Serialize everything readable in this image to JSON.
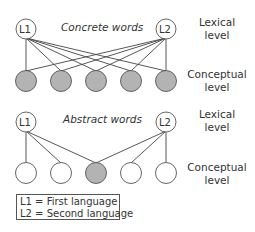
{
  "panels": [
    {
      "title": "Concrete words",
      "lexical_nodes": [
        {
          "label": "L1",
          "x": 26,
          "y": 29
        },
        {
          "label": "L2",
          "x": 166,
          "y": 29
        }
      ],
      "conceptual_nodes": [
        {
          "x": 26,
          "filled": true
        },
        {
          "x": 61,
          "filled": true
        },
        {
          "x": 96,
          "filled": true
        },
        {
          "x": 131,
          "filled": true
        },
        {
          "x": 166,
          "filled": true
        }
      ],
      "conceptual_y": 81,
      "lexical_label": [
        "Lexical",
        "level"
      ],
      "conceptual_label": [
        "Conceptual",
        "level"
      ]
    },
    {
      "title": "Abstract words",
      "lexical_nodes": [
        {
          "label": "L1",
          "x": 26,
          "y": 122
        },
        {
          "label": "L2",
          "x": 166,
          "y": 122
        }
      ],
      "conceptual_nodes": [
        {
          "x": 26,
          "filled": false
        },
        {
          "x": 61,
          "filled": false
        },
        {
          "x": 96,
          "filled": true
        },
        {
          "x": 131,
          "filled": false
        },
        {
          "x": 166,
          "filled": false
        }
      ],
      "conceptual_y": 173,
      "lexical_label": [
        "Lexical",
        "level"
      ],
      "conceptual_label": [
        "Conceptual",
        "level"
      ]
    }
  ],
  "legend": {
    "l1": "L1 = First language",
    "l2": "L2 = Second language"
  },
  "colors": {
    "filled": "#b3b3b3",
    "stroke": "#555555",
    "line": "#444444"
  }
}
